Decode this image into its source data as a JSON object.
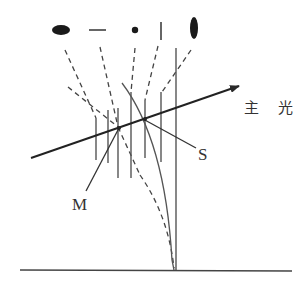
{
  "diagram": {
    "title": "",
    "labels": {
      "main_light": "主 光",
      "point_m": "M",
      "point_s": "S"
    },
    "colors": {
      "ink": "#2a2a2a",
      "line": "#555555",
      "background": "#ffffff"
    },
    "symbols_top_row": [
      {
        "shape": "filled-horizontal-ellipse"
      },
      {
        "shape": "horizontal-dash"
      },
      {
        "shape": "small-dot"
      },
      {
        "shape": "vertical-tick"
      },
      {
        "shape": "filled-vertical-ellipse"
      }
    ]
  }
}
